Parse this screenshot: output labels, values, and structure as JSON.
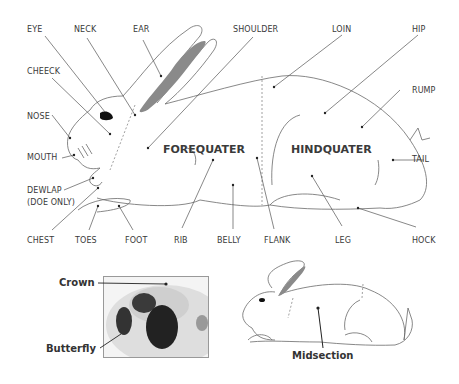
{
  "diagram": {
    "colors": {
      "line": "#6a6a6a",
      "text": "#3a3a3a",
      "ear_inner": "#8a8a8a",
      "eye": "#111111"
    },
    "main_labels": {
      "eye": "EYE",
      "neck": "NECK",
      "ear": "EAR",
      "shoulder": "SHOULDER",
      "loin": "LOIN",
      "hip": "HIP",
      "cheek": "CHEECK",
      "rump": "RUMP",
      "nose": "NOSE",
      "mouth": "MOUTH",
      "tail": "TAIL",
      "dewlap": "DEWLAP",
      "dewlap_note": "(DOE ONLY)",
      "chest": "CHEST",
      "toes": "TOES",
      "foot": "FOOT",
      "rib": "RIB",
      "belly": "BELLY",
      "flank": "FLANK",
      "leg": "LEG",
      "hock": "HOCK"
    },
    "regions": {
      "forequarter": "FOREQUATER",
      "hindquarter": "HINDQUATER"
    },
    "inset_photo": {
      "crown": "Crown",
      "butterfly": "Butterfly"
    },
    "inset_rabbit": {
      "midsection": "Midsection"
    }
  }
}
